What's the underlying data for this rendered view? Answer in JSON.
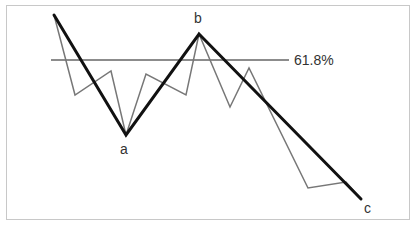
{
  "diagram": {
    "type": "elliott-wave-abc-correction",
    "retracement_label": "61.8%",
    "points": {
      "a": "a",
      "b": "b",
      "c": "c"
    },
    "colors": {
      "thick_line": "#111111",
      "thin_line": "#777777",
      "retracement_line": "#666666",
      "frame": "#c8c8c8",
      "text": "#333333"
    }
  }
}
